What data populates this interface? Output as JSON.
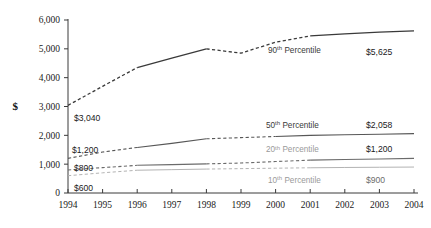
{
  "chart_data": {
    "type": "line",
    "title": "",
    "subtitle": "",
    "xlabel": "",
    "ylabel": "$",
    "x": [
      1994,
      1995,
      1996,
      1997,
      1998,
      1999,
      2000,
      2001,
      2002,
      2003,
      2004
    ],
    "xtick_labels": [
      "1994",
      "1995",
      "1996",
      "1997",
      "1998",
      "1999",
      "2000",
      "2001",
      "2002",
      "2003",
      "2004"
    ],
    "ytick_labels": [
      "0",
      "1,000",
      "2,000",
      "3,000",
      "4,000",
      "5,000",
      "6,000"
    ],
    "yticks": [
      0,
      1000,
      2000,
      3000,
      4000,
      5000,
      6000
    ],
    "ylim": [
      0,
      6000
    ],
    "xlim": [
      1994,
      2004
    ],
    "grid": false,
    "legend": "inline-annotations",
    "series": [
      {
        "name": "90th Percentile",
        "label": "90th Percentile",
        "label_sup": "th",
        "label_base": "90",
        "color": "#3a3a3a",
        "width": 1.3,
        "values": [
          3040,
          3700,
          4350,
          4680,
          5000,
          4850,
          5230,
          5450,
          5520,
          5580,
          5625
        ],
        "dashed_segments": [
          [
            1994,
            1996
          ],
          [
            1998,
            2001
          ]
        ],
        "start_label": "$3,040",
        "end_label": "$5,625",
        "start_value": 3040,
        "end_value": 5625
      },
      {
        "name": "50th Percentile",
        "label": "50th Percentile",
        "label_sup": "th",
        "label_base": "50",
        "color": "#575757",
        "width": 1.1,
        "values": [
          1200,
          1420,
          1580,
          1720,
          1880,
          1920,
          1960,
          2000,
          2020,
          2040,
          2058
        ],
        "dashed_segments": [
          [
            1994,
            1996
          ],
          [
            1998,
            2000
          ]
        ],
        "start_label": "$1,200",
        "end_label": "$2,058",
        "start_value": 1200,
        "end_value": 2058
      },
      {
        "name": "20th Percentile",
        "label": "20th Percentile",
        "label_sup": "th",
        "label_base": "20",
        "color": "#6b6b6b",
        "width": 1.1,
        "values": [
          800,
          880,
          960,
          985,
          1010,
          1040,
          1090,
          1140,
          1160,
          1180,
          1200
        ],
        "dashed_segments": [
          [
            1994,
            1996
          ],
          [
            1998,
            2001
          ]
        ],
        "start_label": "$800",
        "end_label": "$1,200",
        "start_value": 800,
        "end_value": 1200
      },
      {
        "name": "10th Percentile",
        "label": "10th Percentile",
        "label_sup": "th",
        "label_base": "10",
        "color": "#b3b3b3",
        "width": 1.0,
        "values": [
          600,
          700,
          790,
          810,
          830,
          845,
          860,
          875,
          885,
          893,
          900
        ],
        "dashed_segments": [
          [
            1994,
            1996
          ],
          [
            1998,
            2001
          ]
        ],
        "start_label": "$600",
        "end_label": "$900",
        "start_value": 600,
        "end_value": 900
      }
    ]
  },
  "axis": {
    "currency_symbol": "$"
  }
}
